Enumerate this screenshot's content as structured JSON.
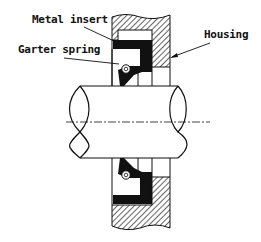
{
  "diagram": {
    "type": "cross-section",
    "labels": {
      "metal_insert": "Metal insert",
      "garter_spring": "Garter spring",
      "housing": "Housing"
    },
    "components": [
      "housing",
      "metal insert",
      "seal lip",
      "garter spring",
      "shaft",
      "centerline"
    ],
    "colors": {
      "line": "#111111",
      "fill_black": "#111111",
      "background": "#ffffff"
    }
  }
}
